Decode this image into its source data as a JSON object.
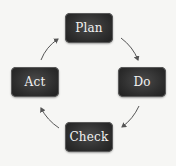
{
  "diagram": {
    "type": "cycle",
    "title": "",
    "nodes": [
      {
        "id": "plan",
        "label": "Plan"
      },
      {
        "id": "do",
        "label": "Do"
      },
      {
        "id": "check",
        "label": "Check"
      },
      {
        "id": "act",
        "label": "Act"
      }
    ],
    "edges": [
      {
        "from": "plan",
        "to": "do"
      },
      {
        "from": "do",
        "to": "check"
      },
      {
        "from": "check",
        "to": "act"
      },
      {
        "from": "act",
        "to": "plan"
      }
    ],
    "colors": {
      "node_fill": "#2e2e2e",
      "node_text": "#f2f2f2",
      "arrow": "#555555",
      "background": "#f6f6f4"
    }
  }
}
